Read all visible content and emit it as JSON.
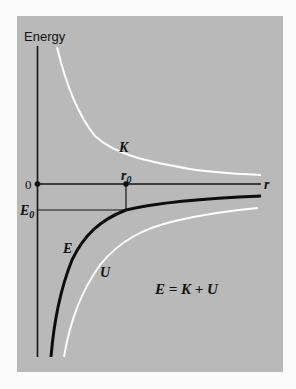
{
  "diagram": {
    "title_axis_y": "Energy",
    "axis_x_label": "r",
    "origin_label": "0",
    "r0_label": "r",
    "r0_subscript": "0",
    "E0_label": "E",
    "E0_subscript": "0",
    "curves": [
      {
        "id": "K",
        "label": "K",
        "description": "kinetic energy",
        "color": "#ffffff"
      },
      {
        "id": "U",
        "label": "U",
        "description": "potential energy",
        "color": "#ffffff"
      },
      {
        "id": "E",
        "label": "E",
        "description": "total energy",
        "color": "#0d0d0d"
      }
    ],
    "equation": "E = K + U",
    "colors": {
      "panel": "#b9b9b9",
      "background": "#fbfbfb",
      "ink": "#111111"
    }
  }
}
